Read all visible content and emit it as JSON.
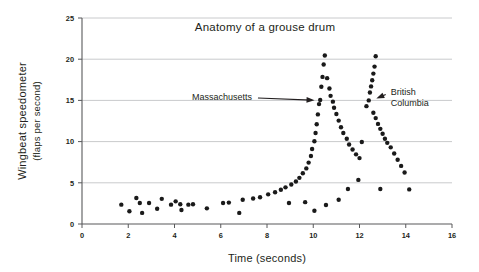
{
  "chart_data": {
    "type": "scatter",
    "title": "Anatomy of a grouse drum",
    "xlabel": "Time (seconds)",
    "ylabel": "Wingbeat speedometer (flaps per second)",
    "ylabel_line1": "Wingbeat speedometer",
    "ylabel_line2": "(flaps per second)",
    "xlim": [
      0,
      16
    ],
    "ylim": [
      0,
      25
    ],
    "xticks": [
      0,
      2,
      4,
      6,
      8,
      10,
      12,
      14,
      16
    ],
    "yticks": [
      0,
      5,
      10,
      15,
      20,
      25
    ],
    "xtick_labels": [
      "0",
      "2",
      "4",
      "6",
      "8",
      "10",
      "12",
      "14",
      "16"
    ],
    "ytick_labels": [
      "0",
      "5",
      "10",
      "15",
      "20",
      "25"
    ],
    "grid": "horizontal",
    "legend": "none",
    "point_color": "#1a1a1a",
    "grid_color": "#c9cacc",
    "axis_color": "#58595b",
    "annotations": [
      {
        "text": "Massachusetts",
        "lines": [
          "Massachusetts"
        ],
        "label_x": 7.35,
        "label_y": 15.05,
        "target_x": 10.25,
        "target_y": 15.0
      },
      {
        "text": "British Columbia",
        "lines": [
          "British",
          "Columbia"
        ],
        "label_x": 13.35,
        "label_y": 15.6,
        "target_x": 12.55,
        "target_y": 15.0
      }
    ],
    "series": [
      {
        "name": "Massachusetts drum",
        "points": [
          [
            1.7,
            2.35
          ],
          [
            2.05,
            1.55
          ],
          [
            2.35,
            3.15
          ],
          [
            2.5,
            2.55
          ],
          [
            2.6,
            1.35
          ],
          [
            2.9,
            2.55
          ],
          [
            3.25,
            1.85
          ],
          [
            3.45,
            3.05
          ],
          [
            3.85,
            2.35
          ],
          [
            4.05,
            2.75
          ],
          [
            4.25,
            2.4
          ],
          [
            4.3,
            1.7
          ],
          [
            4.6,
            2.35
          ],
          [
            4.8,
            2.4
          ],
          [
            5.4,
            1.9
          ],
          [
            6.1,
            2.55
          ],
          [
            6.35,
            2.6
          ],
          [
            6.8,
            1.35
          ],
          [
            6.95,
            2.95
          ],
          [
            7.4,
            3.1
          ],
          [
            7.7,
            3.25
          ],
          [
            8.05,
            3.6
          ],
          [
            8.35,
            3.85
          ],
          [
            8.6,
            4.15
          ],
          [
            8.8,
            4.45
          ],
          [
            8.95,
            2.55
          ],
          [
            9.05,
            4.8
          ],
          [
            9.25,
            5.15
          ],
          [
            9.4,
            5.6
          ],
          [
            9.55,
            6.15
          ],
          [
            9.65,
            2.65
          ],
          [
            9.7,
            6.75
          ],
          [
            9.8,
            7.45
          ],
          [
            9.9,
            8.25
          ],
          [
            9.95,
            9.1
          ],
          [
            10.05,
            10.05
          ],
          [
            10.1,
            11.05
          ],
          [
            10.15,
            12.1
          ],
          [
            10.2,
            13.3
          ],
          [
            10.25,
            14.55
          ],
          [
            10.3,
            15.05
          ],
          [
            10.35,
            16.65
          ],
          [
            10.4,
            17.85
          ],
          [
            10.45,
            19.35
          ],
          [
            10.5,
            20.45
          ]
        ]
      },
      {
        "name": "Massachusetts decay",
        "points": [
          [
            10.6,
            17.7
          ],
          [
            10.7,
            16.45
          ],
          [
            10.75,
            15.55
          ],
          [
            10.85,
            14.85
          ],
          [
            10.9,
            14.1
          ],
          [
            11.0,
            13.35
          ],
          [
            11.1,
            12.55
          ],
          [
            11.2,
            11.75
          ],
          [
            11.3,
            11.05
          ],
          [
            11.45,
            10.35
          ],
          [
            11.55,
            9.65
          ],
          [
            11.7,
            9.05
          ],
          [
            11.85,
            8.45
          ],
          [
            12.0,
            8.0
          ]
        ]
      },
      {
        "name": "British Columbia rise",
        "points": [
          [
            10.05,
            1.6
          ],
          [
            10.55,
            2.3
          ],
          [
            11.1,
            2.95
          ],
          [
            11.5,
            4.25
          ],
          [
            11.95,
            5.35
          ],
          [
            12.1,
            9.95
          ],
          [
            12.3,
            14.3
          ],
          [
            12.4,
            15.0
          ],
          [
            12.45,
            15.95
          ],
          [
            12.5,
            16.7
          ],
          [
            12.55,
            17.45
          ],
          [
            12.6,
            18.25
          ],
          [
            12.65,
            19.1
          ],
          [
            12.7,
            20.35
          ]
        ]
      },
      {
        "name": "British Columbia decay",
        "points": [
          [
            12.6,
            13.5
          ],
          [
            12.7,
            12.85
          ],
          [
            12.8,
            12.15
          ],
          [
            12.9,
            11.55
          ],
          [
            13.0,
            10.95
          ],
          [
            13.1,
            10.35
          ],
          [
            13.2,
            9.85
          ],
          [
            13.35,
            9.3
          ],
          [
            13.5,
            8.55
          ],
          [
            13.65,
            7.8
          ],
          [
            13.8,
            7.05
          ],
          [
            13.95,
            6.25
          ],
          [
            12.9,
            4.25
          ],
          [
            14.15,
            4.2
          ]
        ]
      }
    ]
  }
}
